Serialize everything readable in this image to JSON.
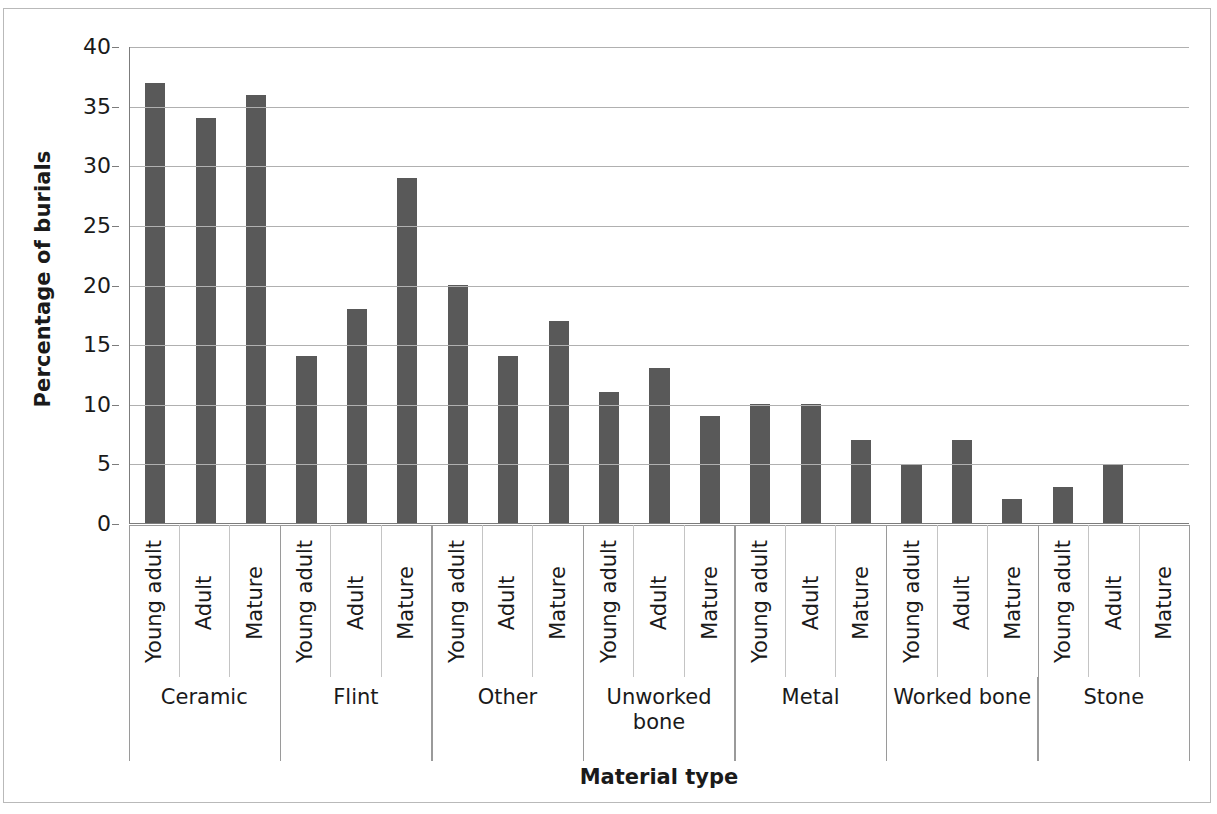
{
  "chart_data": {
    "type": "bar",
    "title": "",
    "xlabel": "Material type",
    "ylabel": "Percentage of burials",
    "ylim": [
      0,
      40
    ],
    "ytick_step": 5,
    "ytick_labels": [
      "40",
      "35",
      "30",
      "25",
      "20",
      "15",
      "10",
      "5",
      "0"
    ],
    "ytick_values": [
      40,
      35,
      30,
      25,
      20,
      15,
      10,
      5,
      0
    ],
    "grid": "horizontal",
    "legend": "none",
    "bar_color": "#595959",
    "gridline_color": "#b0b0b0",
    "axis_color": "#7c7c7c",
    "categories": [
      "Ceramic",
      "Flint",
      "Other",
      "Unworked bone",
      "Metal",
      "Worked bone",
      "Stone"
    ],
    "subcategories": [
      "Young adult",
      "Adult",
      "Mature"
    ],
    "series": [
      {
        "name": "Young adult",
        "values": [
          37,
          14,
          20,
          11,
          10,
          5,
          3
        ]
      },
      {
        "name": "Adult",
        "values": [
          34,
          18,
          14,
          13,
          10,
          7,
          5
        ]
      },
      {
        "name": "Mature",
        "values": [
          36,
          29,
          17,
          9,
          7,
          2,
          0
        ]
      }
    ],
    "bars": [
      {
        "group": "Ceramic",
        "age": "Young adult",
        "value": 37
      },
      {
        "group": "Ceramic",
        "age": "Adult",
        "value": 34
      },
      {
        "group": "Ceramic",
        "age": "Mature",
        "value": 36
      },
      {
        "group": "Flint",
        "age": "Young adult",
        "value": 14
      },
      {
        "group": "Flint",
        "age": "Adult",
        "value": 18
      },
      {
        "group": "Flint",
        "age": "Mature",
        "value": 29
      },
      {
        "group": "Other",
        "age": "Young adult",
        "value": 20
      },
      {
        "group": "Other",
        "age": "Adult",
        "value": 14
      },
      {
        "group": "Other",
        "age": "Mature",
        "value": 17
      },
      {
        "group": "Unworked bone",
        "age": "Young adult",
        "value": 11
      },
      {
        "group": "Unworked bone",
        "age": "Adult",
        "value": 13
      },
      {
        "group": "Unworked bone",
        "age": "Mature",
        "value": 9
      },
      {
        "group": "Metal",
        "age": "Young adult",
        "value": 10
      },
      {
        "group": "Metal",
        "age": "Adult",
        "value": 10
      },
      {
        "group": "Metal",
        "age": "Mature",
        "value": 7
      },
      {
        "group": "Worked bone",
        "age": "Young adult",
        "value": 5
      },
      {
        "group": "Worked bone",
        "age": "Adult",
        "value": 7
      },
      {
        "group": "Worked bone",
        "age": "Mature",
        "value": 2
      },
      {
        "group": "Stone",
        "age": "Young adult",
        "value": 3
      },
      {
        "group": "Stone",
        "age": "Adult",
        "value": 5
      },
      {
        "group": "Stone",
        "age": "Mature",
        "value": 0
      }
    ]
  }
}
